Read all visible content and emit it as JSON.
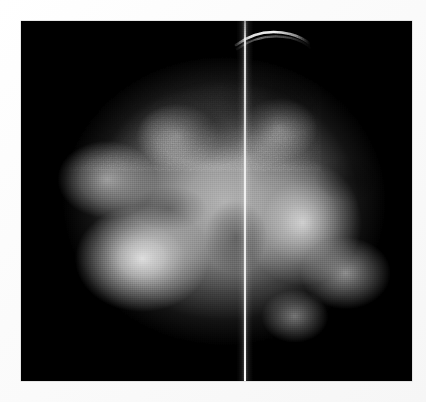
{
  "image": {
    "modality_label": "Mammographic radiograph",
    "view_label": "Craniocaudal-style compressed breast projection",
    "alt_text": "Grayscale mammogram showing a rounded breast silhouette with dense fibroglandular tissue and a bright vertical midline artifact",
    "background_color": "#ffffff",
    "film_color": "#000000",
    "tissue_highlight_color": "#f4f4f4",
    "tissue_midtone_color": "#bababa",
    "artifact_color": "#ffffff"
  },
  "frame": {
    "left_px": 21,
    "top_px": 21,
    "width_px": 391,
    "height_px": 360
  },
  "canvas": {
    "width_px": 426,
    "height_px": 402
  },
  "features": [
    {
      "name": "vertical-midline-artifact",
      "description": "Thin bright vertical line spanning the full image height",
      "x_px": 244,
      "brightness": "high"
    },
    {
      "name": "superior-skin-arc",
      "description": "Bright curved arc at the superior aspect, right of midline",
      "x_px": 240,
      "y_px": 30,
      "brightness": "high"
    },
    {
      "name": "dense-fibroglandular-left",
      "description": "Bright dense tissue in the lower-left quadrant",
      "x_px": 140,
      "y_px": 258,
      "brightness": "high"
    },
    {
      "name": "dense-fibroglandular-right",
      "description": "Bright dense tissue in the center-right region",
      "x_px": 300,
      "y_px": 222,
      "brightness": "medium-high"
    },
    {
      "name": "fatty-region-superior",
      "description": "Darker fatty tissue band across the upper center",
      "x_px": 212,
      "y_px": 122,
      "brightness": "low"
    }
  ]
}
